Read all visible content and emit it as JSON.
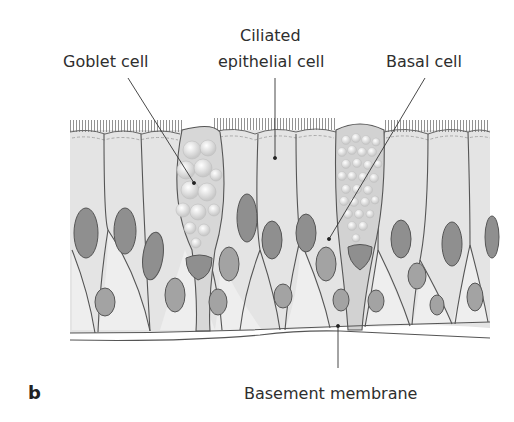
{
  "figure": {
    "panel_letter": "b",
    "labels": {
      "goblet_cell": "Goblet cell",
      "ciliated_line1": "Ciliated",
      "ciliated_line2": "epithelial cell",
      "basal_cell": "Basal cell",
      "basement_membrane": "Basement membrane"
    },
    "colors": {
      "cytoplasm": "#e4e4e4",
      "basal_light": "#eeeeee",
      "nucleus": "#8f8f8f",
      "outline": "#555555",
      "goblet_granules": "#f4f4f4",
      "membrane": "#e8e8e8"
    }
  }
}
